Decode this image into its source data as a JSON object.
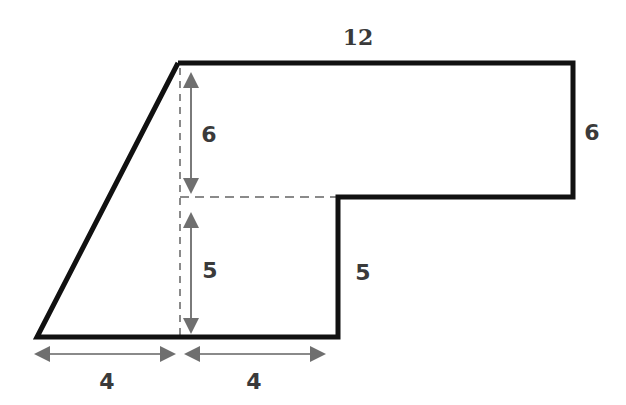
{
  "diagram": {
    "type": "composite-shape-area",
    "shape": "trapezoid-like polygon composed of a right triangle, a lower square and an upper rectangle",
    "labels": {
      "top_width": "12",
      "right_height": "6",
      "step_height": "5",
      "inner_upper_height": "6",
      "inner_lower_height": "5",
      "bottom_left_width": "4",
      "bottom_right_width": "4"
    },
    "colors": {
      "outline": "#111111",
      "dashed": "#8a8a8a",
      "arrow": "#7a7a7a",
      "label": "#3a3a3a"
    }
  }
}
